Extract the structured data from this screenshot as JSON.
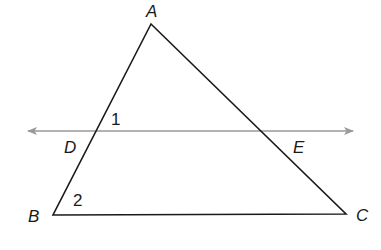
{
  "figure": {
    "type": "geometry-diagram"
  },
  "points": {
    "A": {
      "label": "A",
      "x": 151,
      "y": 24,
      "lx": 146,
      "ly": 17
    },
    "B": {
      "label": "B",
      "x": 53,
      "y": 215,
      "lx": 28,
      "ly": 222
    },
    "C": {
      "label": "C",
      "x": 346,
      "y": 214,
      "lx": 356,
      "ly": 221
    },
    "D": {
      "label": "D",
      "x": 95,
      "y": 131,
      "lx": 64,
      "ly": 153
    },
    "E": {
      "label": "E",
      "x": 262,
      "y": 131,
      "lx": 293,
      "ly": 153
    }
  },
  "angles": {
    "angle1": {
      "label": "1",
      "x": 111,
      "y": 125
    },
    "angle2": {
      "label": "2",
      "x": 73,
      "y": 206
    }
  },
  "transversal": {
    "x1": 28,
    "y1": 131,
    "x2": 353,
    "y2": 131
  },
  "colors": {
    "triangle": "#1a1a1a",
    "line": "#999999",
    "background": "#ffffff"
  }
}
